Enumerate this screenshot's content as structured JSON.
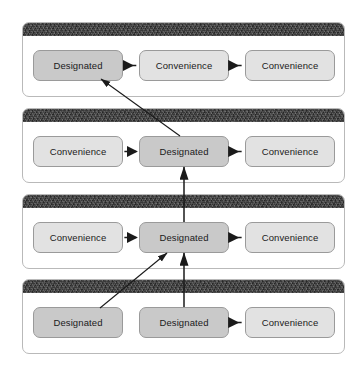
{
  "diagram": {
    "node_types": {
      "designated": {
        "label": "Designated",
        "fill": "#c9c9c9"
      },
      "convenience": {
        "label": "Convenience",
        "fill": "#e2e2e2"
      }
    },
    "panel_header_color": "#3b3b3b",
    "panel_border_color": "#b9b9b9",
    "arrow_color": "#1a1a1a",
    "panels": [
      {
        "id": "panel-1",
        "index": 1,
        "nodes": [
          {
            "slot": "left",
            "type": "designated",
            "label": "Designated"
          },
          {
            "slot": "center",
            "type": "convenience",
            "label": "Convenience"
          },
          {
            "slot": "right",
            "type": "convenience",
            "label": "Convenience"
          }
        ],
        "arrows": [
          {
            "from": "center",
            "to": "left",
            "direction": "left"
          },
          {
            "from": "right",
            "to": "center",
            "direction": "left"
          }
        ]
      },
      {
        "id": "panel-2",
        "index": 2,
        "nodes": [
          {
            "slot": "left",
            "type": "convenience",
            "label": "Convenience"
          },
          {
            "slot": "center",
            "type": "designated",
            "label": "Designated"
          },
          {
            "slot": "right",
            "type": "convenience",
            "label": "Convenience"
          }
        ],
        "arrows": [
          {
            "from": "left",
            "to": "center",
            "direction": "right"
          },
          {
            "from": "right",
            "to": "center",
            "direction": "left"
          }
        ]
      },
      {
        "id": "panel-3",
        "index": 3,
        "nodes": [
          {
            "slot": "left",
            "type": "convenience",
            "label": "Convenience"
          },
          {
            "slot": "center",
            "type": "designated",
            "label": "Designated"
          },
          {
            "slot": "right",
            "type": "convenience",
            "label": "Convenience"
          }
        ],
        "arrows": [
          {
            "from": "left",
            "to": "center",
            "direction": "right"
          },
          {
            "from": "right",
            "to": "center",
            "direction": "left"
          }
        ]
      },
      {
        "id": "panel-4",
        "index": 4,
        "nodes": [
          {
            "slot": "left",
            "type": "designated",
            "label": "Designated"
          },
          {
            "slot": "center",
            "type": "designated",
            "label": "Designated"
          },
          {
            "slot": "right",
            "type": "convenience",
            "label": "Convenience"
          }
        ],
        "arrows": [
          {
            "from": "right",
            "to": "center",
            "direction": "left"
          }
        ]
      }
    ],
    "inter_panel_arrows": [
      {
        "id": "link-p2-to-p1",
        "from_panel": "panel-2",
        "from_slot": "center",
        "to_panel": "panel-1",
        "to_slot": "left",
        "style": "diagonal"
      },
      {
        "id": "link-p3-to-p2",
        "from_panel": "panel-3",
        "from_slot": "center",
        "to_panel": "panel-2",
        "to_slot": "center",
        "style": "vertical"
      },
      {
        "id": "link-p4l-to-p3",
        "from_panel": "panel-4",
        "from_slot": "left",
        "to_panel": "panel-3",
        "to_slot": "center",
        "style": "diagonal"
      },
      {
        "id": "link-p4c-to-p3",
        "from_panel": "panel-4",
        "from_slot": "center",
        "to_panel": "panel-3",
        "to_slot": "center",
        "style": "vertical"
      }
    ]
  }
}
